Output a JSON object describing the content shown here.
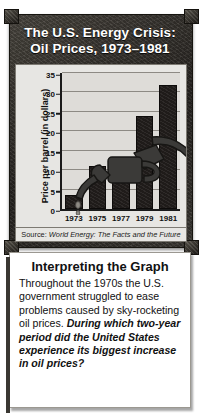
{
  "figure": {
    "title_lines": [
      "The U.S. Energy Crisis:",
      "Oil Prices, 1973–1981"
    ],
    "source_prefix": "Source: ",
    "source_title": "World Energy: The Facts and the Future",
    "nozzle_icon": "gas-pump-nozzle-icon"
  },
  "chart_data": {
    "type": "bar",
    "title": "The U.S. Energy Crisis: Oil Prices, 1973–1981",
    "categories": [
      "1973",
      "1975",
      "1977",
      "1979",
      "1981"
    ],
    "values": [
      3.5,
      11,
      12.5,
      24,
      32
    ],
    "xlabel": "",
    "ylabel": "Price per barrel (in dollars)",
    "ylim": [
      0,
      35
    ],
    "yticks": [
      0,
      5,
      10,
      15,
      20,
      25,
      30,
      35
    ],
    "ytick_labels": [
      "0",
      "5",
      "10",
      "15",
      "20",
      "25",
      "30",
      "35"
    ],
    "grid": true,
    "legend": "none",
    "bar_color": "#231f1d",
    "plot_background": "#dedcd8",
    "source": "Source: World Energy: The Facts and the Future"
  },
  "text_card": {
    "heading": "Interpreting the Graph",
    "body_intro": "Throughout the 1970s the U.S. government struggled to ease problems caused by sky-rocketing oil prices. ",
    "body_question": "During which two-year period did the United States experience its biggest increase in oil prices?"
  },
  "colors": {
    "frame": "#2e2b28",
    "banner_text": "#ffffff",
    "bar": "#231f1d",
    "panel": "#e7e6e3",
    "card": "#ffffff"
  }
}
